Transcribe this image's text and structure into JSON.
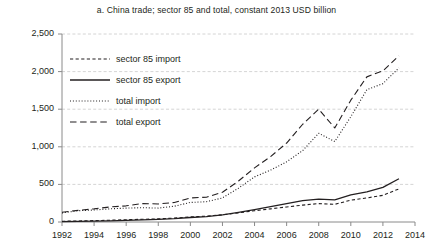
{
  "chart_data": {
    "type": "line",
    "title": "a. China trade; sector 85 and total, constant 2013 USD billion",
    "xlabel": "",
    "ylabel": "",
    "xlim": [
      1992,
      2014
    ],
    "ylim": [
      0,
      2500
    ],
    "grid": true,
    "legend_position": "upper-left-inside",
    "x": [
      1992,
      1993,
      1994,
      1995,
      1996,
      1997,
      1998,
      1999,
      2000,
      2001,
      2002,
      2003,
      2004,
      2005,
      2006,
      2007,
      2008,
      2009,
      2010,
      2011,
      2012,
      2013
    ],
    "xticks": [
      "1992",
      "1994",
      "1996",
      "1998",
      "2000",
      "2002",
      "2004",
      "2006",
      "2008",
      "2010",
      "2012",
      "2014"
    ],
    "yticks": [
      "0",
      "500",
      "1,000",
      "1,500",
      "2,000",
      "2,500"
    ],
    "series": [
      {
        "name": "sector 85 import",
        "style": "dashed",
        "values": [
          10,
          14,
          18,
          24,
          30,
          36,
          42,
          52,
          68,
          78,
          96,
          122,
          150,
          175,
          200,
          225,
          245,
          235,
          290,
          320,
          355,
          440
        ]
      },
      {
        "name": "sector 85 export",
        "style": "solid",
        "values": [
          6,
          9,
          12,
          16,
          21,
          27,
          34,
          44,
          60,
          72,
          95,
          128,
          165,
          205,
          245,
          285,
          305,
          295,
          360,
          400,
          460,
          575
        ]
      },
      {
        "name": "total import",
        "style": "dotted",
        "values": [
          120,
          150,
          160,
          175,
          185,
          190,
          185,
          210,
          260,
          270,
          320,
          450,
          600,
          690,
          800,
          950,
          1180,
          1070,
          1400,
          1760,
          1840,
          2050
        ]
      },
      {
        "name": "total export",
        "style": "long-dashed",
        "values": [
          130,
          155,
          175,
          200,
          215,
          245,
          240,
          260,
          320,
          330,
          395,
          545,
          720,
          870,
          1050,
          1300,
          1500,
          1250,
          1620,
          1930,
          2010,
          2210
        ]
      }
    ]
  },
  "legend": {
    "items": [
      {
        "label": "sector 85 import"
      },
      {
        "label": "sector 85 export"
      },
      {
        "label": "total import"
      },
      {
        "label": "total export"
      }
    ]
  },
  "colors": {
    "ink": "#231f20",
    "grid": "#c9c9c9",
    "axis": "#8a8a8a"
  }
}
